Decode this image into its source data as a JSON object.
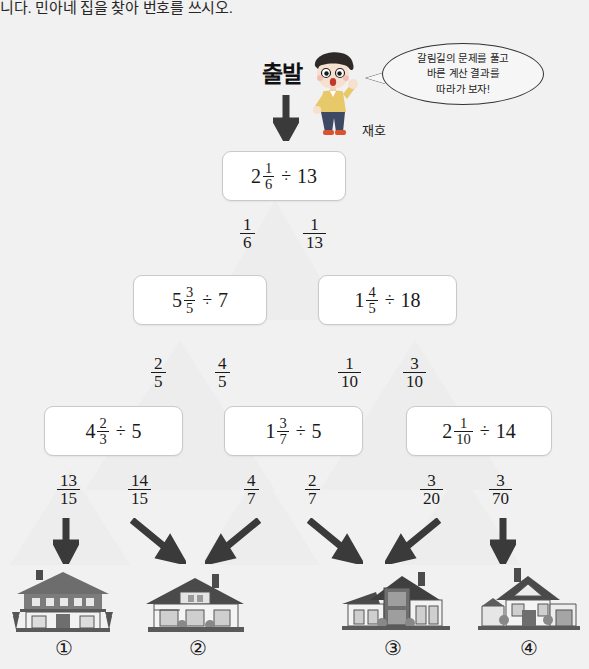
{
  "page": {
    "top_text": "니다. 민아네 집을 찾아 번호를 쓰시오.",
    "start_label": "출발",
    "character_name": "재호",
    "speech_bubble": {
      "line1": "갈림길의 문제를 풀고",
      "line2": "바른 계산 결과를",
      "line3": "따라가 보자!"
    },
    "background_color": "#f1f1f1"
  },
  "boxes": {
    "row1": [
      {
        "whole": "2",
        "num": "1",
        "den": "6",
        "op": "÷",
        "divisor": "13"
      }
    ],
    "row2": [
      {
        "whole": "5",
        "num": "3",
        "den": "5",
        "op": "÷",
        "divisor": "7"
      },
      {
        "whole": "1",
        "num": "4",
        "den": "5",
        "op": "÷",
        "divisor": "18"
      }
    ],
    "row3": [
      {
        "whole": "4",
        "num": "2",
        "den": "3",
        "op": "÷",
        "divisor": "5"
      },
      {
        "whole": "1",
        "num": "3",
        "den": "7",
        "op": "÷",
        "divisor": "5"
      },
      {
        "whole": "2",
        "num": "1",
        "den": "10",
        "op": "÷",
        "divisor": "14"
      }
    ]
  },
  "branch_labels": {
    "level1": [
      {
        "num": "1",
        "den": "6"
      },
      {
        "num": "1",
        "den": "13"
      }
    ],
    "level2": [
      {
        "num": "2",
        "den": "5"
      },
      {
        "num": "4",
        "den": "5"
      },
      {
        "num": "1",
        "den": "10"
      },
      {
        "num": "3",
        "den": "10"
      }
    ],
    "level3": [
      {
        "num": "13",
        "den": "15"
      },
      {
        "num": "14",
        "den": "15"
      },
      {
        "num": "4",
        "den": "7"
      },
      {
        "num": "2",
        "den": "7"
      },
      {
        "num": "3",
        "den": "20"
      },
      {
        "num": "3",
        "den": "70"
      }
    ]
  },
  "houses": [
    {
      "label": "①"
    },
    {
      "label": "②"
    },
    {
      "label": "③"
    },
    {
      "label": "④"
    }
  ]
}
